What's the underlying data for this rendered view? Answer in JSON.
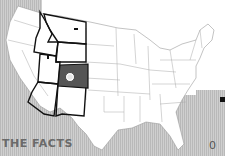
{
  "heading": "THE FACTS",
  "right_fragment": "0",
  "map": {
    "subject": "United States",
    "highlighted_state": "Colorado",
    "outlined_states": [
      "Montana",
      "Idaho",
      "Wyoming",
      "Utah",
      "Colorado",
      "Arizona",
      "New Mexico"
    ],
    "marker_icon": "circle-marker-icon"
  },
  "colors": {
    "background_stripe": "#c4c4c4",
    "highlight_fill": "#555555",
    "outline": "#111111",
    "state_lines": "#9a9a9a"
  }
}
